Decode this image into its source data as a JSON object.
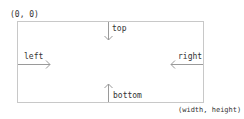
{
  "diagram": {
    "origin_label": "(0, 0)",
    "extent_label": "(width, height)",
    "edges": {
      "top": "top",
      "left": "left",
      "right": "right",
      "bottom": "bottom"
    },
    "colors": {
      "box_stroke": "#c8c8c8",
      "arrow_stroke": "#9a9a9a",
      "text": "#333333"
    }
  }
}
